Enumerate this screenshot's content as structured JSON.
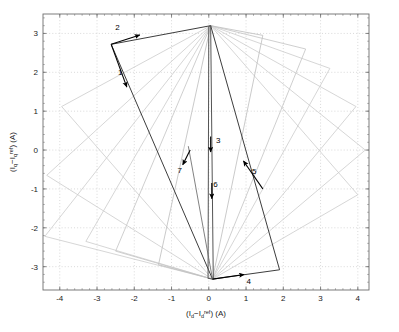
{
  "figure": {
    "type": "phase-plane-trajectory",
    "background": "#ffffff",
    "plot_box": {
      "left": 43,
      "top": 14,
      "right": 369,
      "bottom": 290
    }
  },
  "axes": {
    "x": {
      "label_parts": {
        "open": "(I",
        "sub1": "d",
        "minus": "−I",
        "sub2": "d",
        "sup": "ref",
        "close": ") (A)"
      },
      "label_plain": "(I_d - I_d^ref) (A)",
      "ticks": [
        -4,
        -3,
        -2,
        -1,
        0,
        1,
        2,
        3,
        4
      ],
      "tick_labels": [
        "-4",
        "-3",
        "-2",
        "-1",
        "0",
        "1",
        "2",
        "3",
        "4"
      ],
      "lim": [
        -4.45,
        4.3
      ]
    },
    "y": {
      "label_parts": {
        "open": "(I",
        "sub1": "q",
        "minus": "−I",
        "sub2": "q",
        "sup": "ref",
        "close": ") (A)"
      },
      "label_plain": "(I_q - I_q^ref) (A)",
      "ticks": [
        3,
        2,
        1,
        0,
        -1,
        -2,
        -3
      ],
      "tick_labels": [
        "3",
        "2",
        "1",
        "0",
        "-1",
        "-2",
        "-3"
      ],
      "lim": [
        -3.6,
        3.5
      ]
    },
    "grid": "dotted",
    "grid_color": "#bfbfbf",
    "frame_color": "#6e6e6e"
  },
  "colors": {
    "trajectory_light": "#cfcfcf",
    "trajectory_mid": "#b4b4b4",
    "trajectory_dark": "#3d3d3d",
    "arrow": "#000000",
    "text": "#1a1a1a"
  },
  "chart_data": {
    "type": "line",
    "title": "",
    "xlabel": "(I_d - I_d^ref) (A)",
    "ylabel": "(I_q - I_q^ref) (A)",
    "xlim": [
      -4.45,
      4.3
    ],
    "ylim": [
      -3.6,
      3.5
    ],
    "grid": true,
    "legend": "none",
    "apex_top": [
      0.05,
      3.2
    ],
    "apex_bottom": [
      0.1,
      -3.32
    ],
    "series": [
      {
        "name": "loop-1-outermost",
        "shade": "#cfcfcf",
        "closed": true,
        "points": [
          [
            0.05,
            3.2
          ],
          [
            4.0,
            -1.15
          ],
          [
            0.1,
            -3.32
          ],
          [
            -3.95,
            1.12
          ],
          [
            0.05,
            3.2
          ]
        ]
      },
      {
        "name": "loop-2",
        "shade": "#cfcfcf",
        "closed": true,
        "points": [
          [
            0.05,
            3.2
          ],
          [
            4.2,
            0.0
          ],
          [
            0.1,
            -3.32
          ],
          [
            -4.35,
            -0.65
          ],
          [
            0.05,
            3.2
          ]
        ]
      },
      {
        "name": "loop-3",
        "shade": "#cfcfcf",
        "closed": true,
        "points": [
          [
            0.05,
            3.2
          ],
          [
            3.95,
            1.12
          ],
          [
            0.1,
            -3.32
          ],
          [
            -4.4,
            -2.22
          ],
          [
            0.05,
            3.2
          ]
        ]
      },
      {
        "name": "loop-4",
        "shade": "#cfcfcf",
        "closed": true,
        "points": [
          [
            0.05,
            3.2
          ],
          [
            3.25,
            2.1
          ],
          [
            0.1,
            -3.32
          ],
          [
            -3.3,
            -2.35
          ],
          [
            0.05,
            3.2
          ]
        ]
      },
      {
        "name": "loop-5",
        "shade": "#c6c6c6",
        "closed": true,
        "points": [
          [
            0.05,
            3.2
          ],
          [
            2.6,
            2.6
          ],
          [
            0.1,
            -3.32
          ],
          [
            -2.5,
            -2.6
          ],
          [
            0.05,
            3.2
          ]
        ]
      },
      {
        "name": "loop-6",
        "shade": "#c0c0c0",
        "closed": true,
        "points": [
          [
            0.05,
            3.2
          ],
          [
            1.45,
            2.95
          ],
          [
            0.1,
            -3.32
          ],
          [
            -1.35,
            -2.95
          ],
          [
            0.05,
            3.2
          ]
        ]
      },
      {
        "name": "loop-7-dark-final",
        "shade": "#3d3d3d",
        "closed": true,
        "points": [
          [
            0.05,
            3.2
          ],
          [
            1.9,
            -3.08
          ],
          [
            0.1,
            -3.32
          ],
          [
            -2.62,
            2.72
          ],
          [
            0.05,
            3.2
          ]
        ]
      },
      {
        "name": "loop-8-degenerate-vertical",
        "shade": "#555555",
        "closed": true,
        "points": [
          [
            0.05,
            3.2
          ],
          [
            0.12,
            -3.32
          ],
          [
            -0.02,
            -3.3
          ],
          [
            0.0,
            3.18
          ]
        ]
      },
      {
        "name": "segment-7-approach",
        "shade": "#6a6a6a",
        "closed": false,
        "points": [
          [
            -0.55,
            0.1
          ],
          [
            0.1,
            -3.32
          ]
        ]
      }
    ],
    "annotations": [
      {
        "id": "1",
        "label": "1",
        "label_xy": [
          -2.38,
          1.93
        ],
        "arrow_from": [
          -2.62,
          2.72
        ],
        "arrow_to": [
          -2.2,
          1.62
        ],
        "on": "loop-7-dark-final"
      },
      {
        "id": "2",
        "label": "2",
        "label_xy": [
          -2.45,
          3.1
        ],
        "arrow_from": [
          -2.62,
          2.72
        ],
        "arrow_to": [
          -1.85,
          2.96
        ],
        "on": "loop-7-dark-final"
      },
      {
        "id": "3",
        "label": "3",
        "label_xy": [
          0.25,
          0.18
        ],
        "arrow_from": [
          0.05,
          0.35
        ],
        "arrow_to": [
          0.05,
          -0.05
        ],
        "on": "loop-8-degenerate-vertical"
      },
      {
        "id": "4",
        "label": "4",
        "label_xy": [
          1.07,
          -3.45
        ],
        "arrow_from": [
          0.1,
          -3.32
        ],
        "arrow_to": [
          0.95,
          -3.2
        ],
        "on": "loop-7-dark-final"
      },
      {
        "id": "5",
        "label": "5",
        "label_xy": [
          1.22,
          -0.62
        ],
        "arrow_from": [
          1.45,
          -1.0
        ],
        "arrow_to": [
          0.93,
          -0.28
        ],
        "on": "loop-7-dark-final"
      },
      {
        "id": "6",
        "label": "6",
        "label_xy": [
          0.18,
          -0.95
        ],
        "arrow_from": [
          0.08,
          -0.85
        ],
        "arrow_to": [
          0.08,
          -1.25
        ],
        "on": "loop-8-degenerate-vertical"
      },
      {
        "id": "7",
        "label": "7",
        "label_xy": [
          -0.78,
          -0.6
        ],
        "arrow_from": [
          -0.5,
          0.0
        ],
        "arrow_to": [
          -0.7,
          -0.38
        ],
        "on": "segment-7-approach"
      }
    ]
  }
}
